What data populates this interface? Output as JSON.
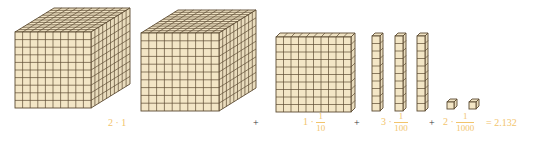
{
  "colors": {
    "front": "#f3e6c6",
    "side": "#e9dcbd",
    "top": "#efe2c3",
    "line": "#5b4b32",
    "label": "#f2c46c",
    "operator": "#333333"
  },
  "blocks": {
    "cubes": [
      {
        "name": "thousand-cube-1",
        "x": 15,
        "y": 32,
        "size": 76,
        "dx": 39,
        "dy": -24,
        "grid": 10
      },
      {
        "name": "thousand-cube-2",
        "x": 141,
        "y": 33,
        "size": 78,
        "dx": 37,
        "dy": -23,
        "grid": 10
      }
    ],
    "flat": {
      "x": 276,
      "y": 37,
      "w": 75,
      "h": 75,
      "dx": 4,
      "dy": -4,
      "grid": 10
    },
    "rods": [
      {
        "x": 372,
        "y": 36,
        "w": 8,
        "h": 75,
        "dx": 3,
        "dy": -3,
        "grid": 10
      },
      {
        "x": 395,
        "y": 36,
        "w": 8,
        "h": 75,
        "dx": 3,
        "dy": -3,
        "grid": 10
      },
      {
        "x": 417,
        "y": 36,
        "w": 8,
        "h": 75,
        "dx": 3,
        "dy": -3,
        "grid": 10
      }
    ],
    "units": [
      {
        "x": 447,
        "y": 102,
        "s": 7,
        "d": 3
      },
      {
        "x": 469,
        "y": 102,
        "s": 7,
        "d": 3
      }
    ]
  },
  "equation": {
    "term1": {
      "coef": "2",
      "dot": "·",
      "value": "1"
    },
    "plus1": "+",
    "term2": {
      "coef": "1",
      "dot": "·",
      "num": "1",
      "den": "10"
    },
    "plus2": "+",
    "term3": {
      "coef": "3",
      "dot": "·",
      "num": "1",
      "den": "100"
    },
    "plus3": "+",
    "term4": {
      "coef": "2",
      "dot": "·",
      "num": "1",
      "den": "1000"
    },
    "result": "= 2.132"
  }
}
